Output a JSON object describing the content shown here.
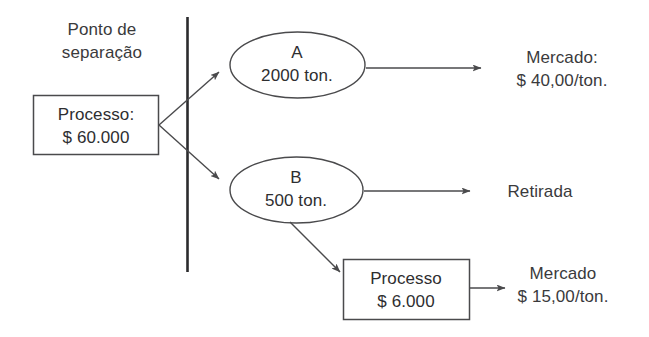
{
  "diagram": {
    "colors": {
      "stroke": "#4a4a4c",
      "split_line": "#2b2b2d",
      "text": "#3a3a3c",
      "background": "#ffffff"
    },
    "annotations": {
      "separation_point": "Ponto de\nseparação"
    },
    "nodes": {
      "process_box": {
        "line1": "Processo:",
        "line2": "$ 60.000",
        "text": "Processo:\n$ 60.000"
      },
      "ellipse_a": {
        "line1": "A",
        "line2": "2000 ton.",
        "text": "A\n2000 ton."
      },
      "ellipse_b": {
        "line1": "B",
        "line2": "500 ton.",
        "text": "B\n500 ton."
      },
      "process2_box": {
        "line1": "Processo",
        "line2": "$ 6.000",
        "text": "Processo\n$ 6.000"
      }
    },
    "outputs": {
      "market_a": {
        "line1": "Mercado:",
        "line2": "$ 40,00/ton.",
        "text": "Mercado:\n$ 40,00/ton."
      },
      "withdrawal": {
        "text": "Retirada"
      },
      "market_b": {
        "line1": "Mercado",
        "line2": "$ 15,00/ton.",
        "text": "Mercado\n$ 15,00/ton."
      }
    }
  }
}
